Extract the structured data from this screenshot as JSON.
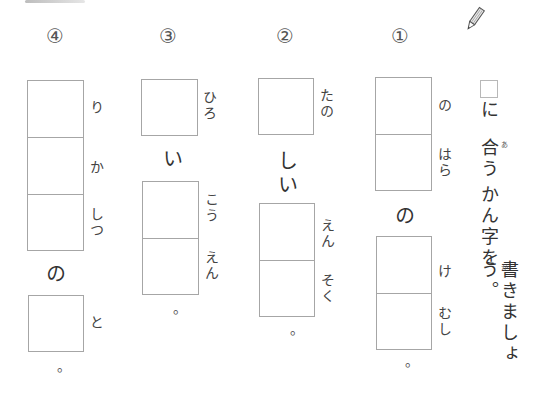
{
  "worksheet": {
    "instruction": {
      "icon": "pencil-icon",
      "box_label": "□",
      "segments": [
        "に",
        "合う",
        "かん字を",
        "書きましょう。"
      ],
      "ruby": {
        "合": "あ",
        "書": "か"
      },
      "full_text": "□に合うかん字を書きましょう。"
    },
    "questions": [
      {
        "number": "①",
        "parts": [
          {
            "type": "boxes",
            "count": 2,
            "readings": [
              "の",
              "はら"
            ]
          },
          {
            "type": "text",
            "value": "の"
          },
          {
            "type": "boxes",
            "count": 2,
            "readings": [
              "け",
              "むし"
            ]
          },
          {
            "type": "text",
            "value": "。"
          }
        ]
      },
      {
        "number": "②",
        "parts": [
          {
            "type": "boxes",
            "count": 1,
            "readings": [
              "たの"
            ]
          },
          {
            "type": "text",
            "value": "しい"
          },
          {
            "type": "boxes",
            "count": 2,
            "readings": [
              "えん",
              "そく"
            ]
          },
          {
            "type": "text",
            "value": "。"
          }
        ]
      },
      {
        "number": "③",
        "parts": [
          {
            "type": "boxes",
            "count": 1,
            "readings": [
              "ひろ"
            ]
          },
          {
            "type": "text",
            "value": "い"
          },
          {
            "type": "boxes",
            "count": 2,
            "readings": [
              "こう",
              "えん"
            ]
          },
          {
            "type": "text",
            "value": "。"
          }
        ]
      },
      {
        "number": "④",
        "parts": [
          {
            "type": "boxes",
            "count": 3,
            "readings": [
              "り",
              "か",
              "しつ"
            ]
          },
          {
            "type": "text",
            "value": "の"
          },
          {
            "type": "boxes",
            "count": 1,
            "readings": [
              "と"
            ]
          },
          {
            "type": "text",
            "value": "。"
          }
        ]
      }
    ]
  }
}
